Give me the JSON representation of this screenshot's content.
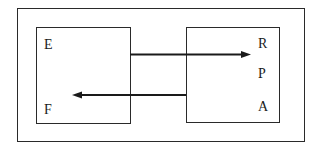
{
  "diagram": {
    "type": "mapping-diagram",
    "left_set": {
      "elements": [
        "E",
        "F"
      ]
    },
    "right_set": {
      "elements": [
        "R",
        "P",
        "A"
      ]
    },
    "arrows": [
      {
        "from": "left-box",
        "to": "R",
        "direction": "right"
      },
      {
        "from": "right-box",
        "to": "F",
        "direction": "left"
      }
    ],
    "colors": {
      "line": "#1a1a1a",
      "background": "#ffffff"
    }
  }
}
